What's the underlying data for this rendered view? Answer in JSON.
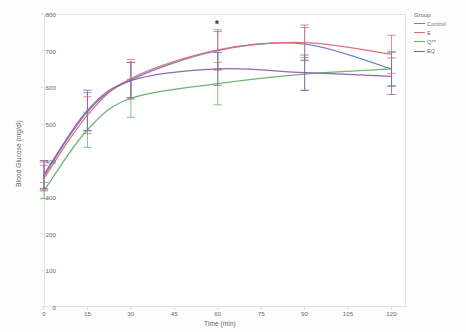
{
  "chart_data": {
    "type": "line",
    "title": "",
    "xlabel": "Time (min)",
    "ylabel": "Blood Glucose (mg/dl)",
    "x": [
      0,
      15,
      30,
      60,
      90,
      120
    ],
    "xlim": [
      0,
      125
    ],
    "ylim": [
      0,
      800
    ],
    "xticks": [
      "0",
      "15",
      "30",
      "45",
      "60",
      "75",
      "90",
      "105",
      "120"
    ],
    "xtick_values": [
      0,
      15,
      30,
      45,
      60,
      75,
      90,
      105,
      120
    ],
    "yticks": [
      "0",
      "100",
      "200",
      "300",
      "400",
      "500",
      "600",
      "700",
      "800"
    ],
    "ytick_values": [
      0,
      100,
      200,
      300,
      400,
      500,
      600,
      700,
      800
    ],
    "grid": false,
    "legend_position": "right",
    "legend_title": "Group",
    "series": [
      {
        "name": "Control",
        "color": "#6a7fc4",
        "values": [
          358,
          533,
          620,
          700,
          718,
          650
        ],
        "err_low": [
          38,
          52,
          48,
          52,
          45,
          48
        ],
        "err_high": [
          38,
          52,
          48,
          52,
          45,
          48
        ]
      },
      {
        "name": "E",
        "color": "#e06a78",
        "values": [
          352,
          524,
          624,
          702,
          722,
          690
        ],
        "err_low": [
          35,
          50,
          52,
          55,
          48,
          52
        ],
        "err_high": [
          35,
          50,
          52,
          55,
          48,
          52
        ]
      },
      {
        "name": "Q**",
        "color": "#63b06d",
        "values": [
          318,
          484,
          570,
          610,
          636,
          650
        ],
        "err_low": [
          22,
          48,
          52,
          58,
          45,
          45
        ],
        "err_high": [
          22,
          48,
          52,
          58,
          45,
          45
        ]
      },
      {
        "name": "EQ",
        "color": "#8a5fa8",
        "values": [
          362,
          537,
          618,
          650,
          640,
          630
        ],
        "err_low": [
          38,
          55,
          50,
          45,
          48,
          50
        ],
        "err_high": [
          38,
          55,
          50,
          45,
          48,
          50
        ]
      }
    ],
    "annotations": [
      {
        "text": "*",
        "x": 60,
        "y": 772
      }
    ]
  }
}
